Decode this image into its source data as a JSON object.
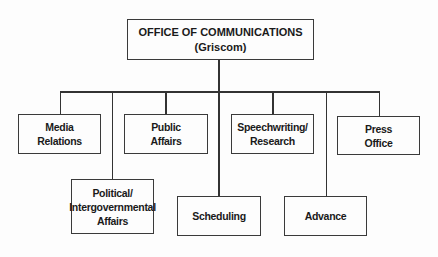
{
  "diagram": {
    "type": "org-chart",
    "root": {
      "title": "OFFICE OF COMMUNICATIONS",
      "subtitle": "(Griscom)"
    },
    "children": [
      {
        "id": "media-relations",
        "lines": [
          "Media",
          "Relations"
        ],
        "row": 1
      },
      {
        "id": "political-affairs",
        "lines": [
          "Political/",
          "Intergovernmental",
          "Affairs"
        ],
        "row": 2
      },
      {
        "id": "public-affairs",
        "lines": [
          "Public",
          "Affairs"
        ],
        "row": 1
      },
      {
        "id": "scheduling",
        "lines": [
          "Scheduling"
        ],
        "row": 2
      },
      {
        "id": "speechwriting-research",
        "lines": [
          "Speechwriting/",
          "Research"
        ],
        "row": 1
      },
      {
        "id": "advance",
        "lines": [
          "Advance"
        ],
        "row": 2
      },
      {
        "id": "press-office",
        "lines": [
          "Press",
          "Office"
        ],
        "row": 1
      }
    ],
    "colors": {
      "line": "#333333",
      "border": "#3a3a3a",
      "background": "#fdfdfd",
      "text": "#1a1a1a"
    }
  }
}
